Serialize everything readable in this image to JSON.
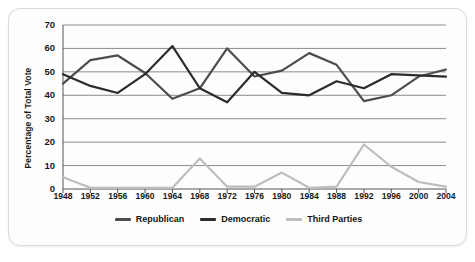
{
  "chart_data": {
    "type": "line",
    "title": "",
    "xlabel": "",
    "ylabel": "Percentage of Total Vote",
    "ylim": [
      0,
      70
    ],
    "yticks": [
      0,
      10,
      20,
      30,
      40,
      50,
      60,
      70
    ],
    "grid": true,
    "legend_position": "bottom",
    "categories": [
      1948,
      1952,
      1956,
      1960,
      1964,
      1968,
      1972,
      1976,
      1980,
      1984,
      1988,
      1992,
      1996,
      2000,
      2004
    ],
    "x_tick_labels": [
      "1948",
      "1952",
      "1956",
      "1960",
      "1964",
      "1968",
      "1972",
      "1976",
      "1980",
      "1984",
      "1988",
      "1992",
      "1996",
      "2000",
      "2004"
    ],
    "y_tick_labels": [
      "0",
      "10",
      "20",
      "30",
      "40",
      "50",
      "60",
      "70"
    ],
    "series": [
      {
        "name": "Republican",
        "color": "#4d4d4d",
        "values": [
          45,
          55,
          57,
          49.5,
          38.5,
          43,
          60,
          48,
          50.5,
          58,
          53,
          37.5,
          40,
          48,
          51
        ]
      },
      {
        "name": "Democratic",
        "color": "#2b2b2b",
        "values": [
          49,
          44,
          41,
          49,
          61,
          43,
          37,
          50,
          41,
          40,
          46,
          43,
          49,
          48.5,
          48
        ]
      },
      {
        "name": "Third Parties",
        "color": "#bdbdbd",
        "values": [
          5,
          0.5,
          0.5,
          0.5,
          0.5,
          13,
          1,
          1,
          7,
          0.5,
          1,
          19,
          9.5,
          3,
          1
        ]
      }
    ]
  },
  "legend": {
    "items": [
      {
        "label": "Republican",
        "color": "#4d4d4d"
      },
      {
        "label": "Democratic",
        "color": "#2b2b2b"
      },
      {
        "label": "Third Parties",
        "color": "#bdbdbd"
      }
    ]
  },
  "axis": {
    "y_title": "Percentage of Total Vote"
  }
}
